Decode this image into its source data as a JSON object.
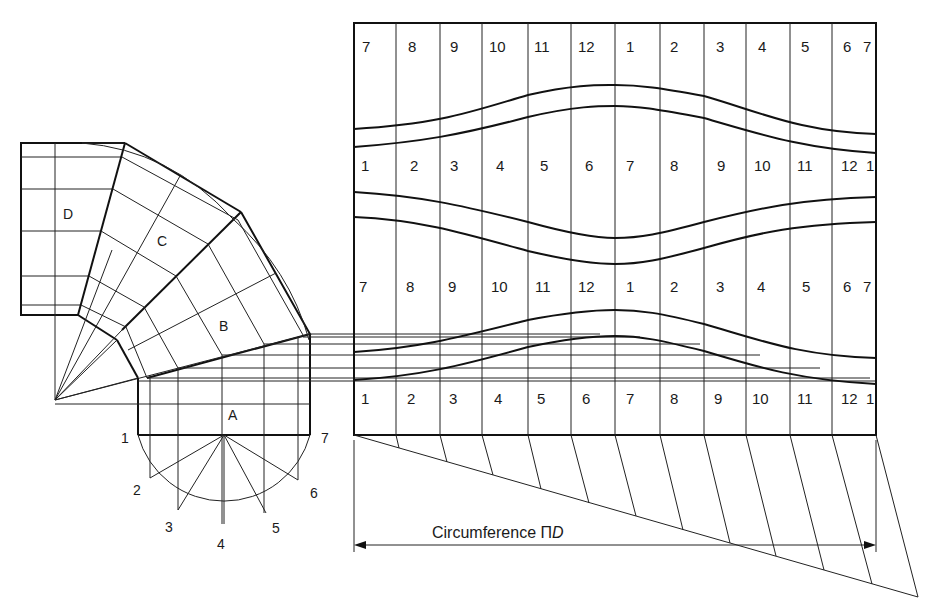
{
  "diagram": {
    "type": "sheet-metal development of a four-segment pipe elbow",
    "segments": [
      "A",
      "B",
      "C",
      "D"
    ],
    "semicircle_points": [
      "1",
      "2",
      "3",
      "4",
      "5",
      "6",
      "7"
    ],
    "pattern_rows": [
      {
        "name": "row-1",
        "labels": [
          "7",
          "8",
          "9",
          "10",
          "11",
          "12",
          "1",
          "2",
          "3",
          "4",
          "5",
          "6",
          "7"
        ]
      },
      {
        "name": "row-2",
        "labels": [
          "1",
          "2",
          "3",
          "4",
          "5",
          "6",
          "7",
          "8",
          "9",
          "10",
          "11",
          "12",
          "1"
        ]
      },
      {
        "name": "row-3",
        "labels": [
          "7",
          "8",
          "9",
          "10",
          "11",
          "12",
          "1",
          "2",
          "3",
          "4",
          "5",
          "6",
          "7"
        ]
      },
      {
        "name": "row-4",
        "labels": [
          "1",
          "2",
          "3",
          "4",
          "5",
          "6",
          "7",
          "8",
          "9",
          "10",
          "11",
          "12",
          "1"
        ]
      }
    ],
    "dimension": {
      "label_text": "Circumference ",
      "label_symbol": "Π",
      "label_var": "D"
    },
    "colors": {
      "line": "#111111",
      "background": "#ffffff"
    }
  }
}
